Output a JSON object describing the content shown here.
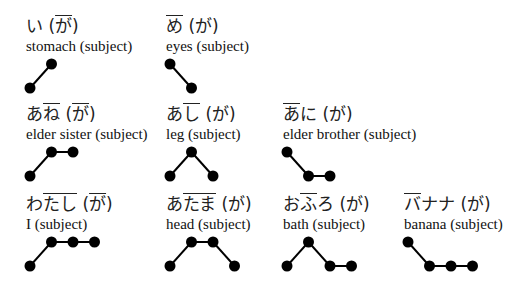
{
  "entries": [
    {
      "id": "i",
      "kana_parts": [
        {
          "t": "い",
          "ol": false
        },
        {
          "t": " (",
          "ol": false
        },
        {
          "t": "が",
          "ol": true
        },
        {
          "t": ")",
          "ol": false
        }
      ],
      "gloss": "stomach (subject)",
      "pitch": [
        "L",
        "H"
      ],
      "pos": {
        "x": 26,
        "y": 16
      }
    },
    {
      "id": "me",
      "kana_parts": [
        {
          "t": "め",
          "ol": true
        },
        {
          "t": " (が)",
          "ol": false
        }
      ],
      "gloss": "eyes (subject)",
      "pitch": [
        "H",
        "L"
      ],
      "pos": {
        "x": 166,
        "y": 16
      }
    },
    {
      "id": "ane",
      "kana_parts": [
        {
          "t": "あ",
          "ol": false
        },
        {
          "t": "ね",
          "ol": true
        },
        {
          "t": " (",
          "ol": false
        },
        {
          "t": "が",
          "ol": true
        },
        {
          "t": ")",
          "ol": false
        }
      ],
      "gloss": "elder sister (subject)",
      "pitch": [
        "L",
        "H",
        "H"
      ],
      "pos": {
        "x": 26,
        "y": 104
      }
    },
    {
      "id": "ashi",
      "kana_parts": [
        {
          "t": "あ",
          "ol": false
        },
        {
          "t": "し",
          "ol": true
        },
        {
          "t": " (が)",
          "ol": false
        }
      ],
      "gloss": "leg (subject)",
      "pitch": [
        "L",
        "H",
        "L"
      ],
      "pos": {
        "x": 166,
        "y": 104
      }
    },
    {
      "id": "ani",
      "kana_parts": [
        {
          "t": "あ",
          "ol": true
        },
        {
          "t": "に (が)",
          "ol": false
        }
      ],
      "gloss": "elder brother (subject)",
      "pitch": [
        "H",
        "L",
        "L"
      ],
      "pos": {
        "x": 283,
        "y": 104
      }
    },
    {
      "id": "watashi",
      "kana_parts": [
        {
          "t": "わ",
          "ol": false
        },
        {
          "t": "たし",
          "ol": true
        },
        {
          "t": " (",
          "ol": false
        },
        {
          "t": "が",
          "ol": true
        },
        {
          "t": ")",
          "ol": false
        }
      ],
      "gloss": "I (subject)",
      "pitch": [
        "L",
        "H",
        "H",
        "H"
      ],
      "pos": {
        "x": 26,
        "y": 194
      }
    },
    {
      "id": "atama",
      "kana_parts": [
        {
          "t": "あ",
          "ol": false
        },
        {
          "t": "たま",
          "ol": true
        },
        {
          "t": " (が)",
          "ol": false
        }
      ],
      "gloss": "head (subject)",
      "pitch": [
        "L",
        "H",
        "H",
        "L"
      ],
      "pos": {
        "x": 166,
        "y": 194
      }
    },
    {
      "id": "furo",
      "kana_parts": [
        {
          "t": "お",
          "ol": false
        },
        {
          "t": "ふ",
          "ol": true
        },
        {
          "t": "ろ (が)",
          "ol": false
        }
      ],
      "gloss": "bath (subject)",
      "pitch": [
        "L",
        "H",
        "L",
        "L"
      ],
      "pos": {
        "x": 283,
        "y": 194
      }
    },
    {
      "id": "banana",
      "kana_parts": [
        {
          "t": "バ",
          "ol": true
        },
        {
          "t": "ナナ (が)",
          "ol": false
        }
      ],
      "gloss": "banana (subject)",
      "pitch": [
        "H",
        "L",
        "L",
        "L"
      ],
      "pos": {
        "x": 404,
        "y": 194
      }
    }
  ],
  "style": {
    "dot_color": "#000000",
    "line_color": "#000000",
    "dot_radius": 5.5,
    "step_x": 21.5,
    "high_y": 48,
    "low_y": 72
  }
}
